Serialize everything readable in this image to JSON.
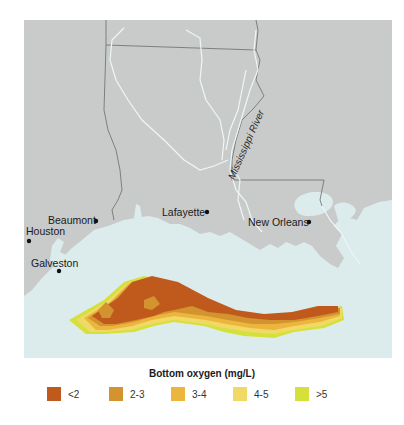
{
  "map": {
    "colors": {
      "land": "#c9cbcb",
      "water": "#dcecec",
      "state_border": "#6a6c6c",
      "river": "#e8f2f2"
    },
    "river_label": "Mississippi River",
    "cities": [
      {
        "name": "Beaumont",
        "label_pos": "left"
      },
      {
        "name": "Houston",
        "label_pos": "above"
      },
      {
        "name": "Galveston",
        "label_pos": "above"
      },
      {
        "name": "Lafayette",
        "label_pos": "left"
      },
      {
        "name": "New Orleans",
        "label_pos": "left"
      }
    ]
  },
  "legend": {
    "title": "Bottom oxygen (mg/L)",
    "items": [
      {
        "label": "<2",
        "color": "#bf5a1c"
      },
      {
        "label": "2-3",
        "color": "#d3932f"
      },
      {
        "label": "3-4",
        "color": "#ebb53e"
      },
      {
        "label": "4-5",
        "color": "#f0d964"
      },
      {
        "label": ">5",
        "color": "#d6e03a"
      }
    ]
  }
}
